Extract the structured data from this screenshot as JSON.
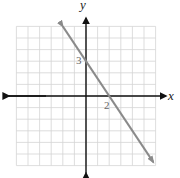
{
  "chart_data": {
    "type": "line",
    "title": "",
    "xlabel": "x",
    "ylabel": "y",
    "xlim": [
      -6,
      6
    ],
    "ylim": [
      -6,
      6
    ],
    "grid": true,
    "series": [
      {
        "name": "line",
        "equation": "y = -3/2 x + 3",
        "x": [
          -2,
          5.8
        ],
        "y": [
          6,
          -5.7
        ],
        "color": "#8a8a8a"
      }
    ],
    "annotations": [
      {
        "text": "3",
        "x": 0,
        "y": 3,
        "note": "y-intercept"
      },
      {
        "text": "2",
        "x": 2,
        "y": 0,
        "note": "x-intercept"
      }
    ]
  },
  "labels": {
    "x_axis": "x",
    "y_axis": "y",
    "y_intercept": "3",
    "x_intercept": "2"
  },
  "colors": {
    "grid": "#d4d4d4",
    "axis": "#111111",
    "line": "#8a8a8a"
  }
}
